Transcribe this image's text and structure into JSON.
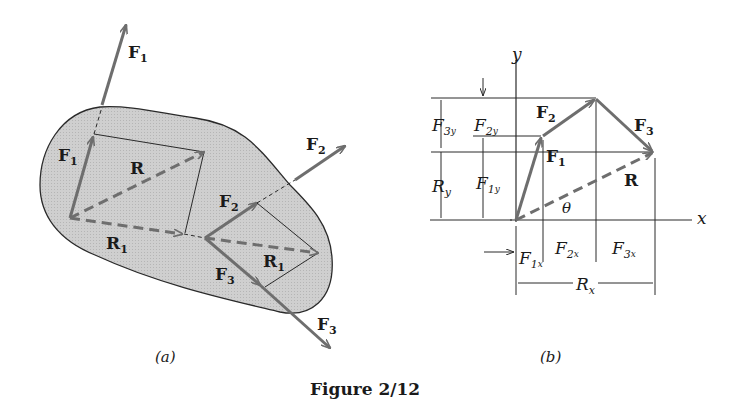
{
  "figure": {
    "caption": "Figure 2/12",
    "panel_a_label": "(a)",
    "panel_b_label": "(b)"
  },
  "colors": {
    "body_fill": "#c9c9c9",
    "body_outline": "#2a2a2a",
    "vector": "#6e6e6e",
    "line": "#2a2a2a",
    "text": "#1a1a1a"
  },
  "panel_a": {
    "labels": {
      "F1_outer": {
        "base": "F",
        "sub": "1"
      },
      "F1_inner": {
        "base": "F",
        "sub": "1"
      },
      "R": {
        "base": "R"
      },
      "R1_left": {
        "base": "R",
        "sub": "1"
      },
      "R1_right": {
        "base": "R",
        "sub": "1"
      },
      "F2_outer": {
        "base": "F",
        "sub": "2"
      },
      "F2_inner": {
        "base": "F",
        "sub": "2"
      },
      "F3_inner": {
        "base": "F",
        "sub": "3"
      },
      "F3_outer": {
        "base": "F",
        "sub": "3"
      }
    }
  },
  "panel_b": {
    "axes": {
      "x": "x",
      "y": "y"
    },
    "vectors": {
      "F1": {
        "base": "F",
        "sub": "1"
      },
      "F2": {
        "base": "F",
        "sub": "2"
      },
      "F3": {
        "base": "F",
        "sub": "3"
      },
      "R": {
        "base": "R"
      }
    },
    "angle": "θ",
    "dimensions": {
      "F3y": {
        "base": "F",
        "sub": "3",
        "subsub": "y"
      },
      "F2y": {
        "base": "F",
        "sub": "2",
        "subsub": "y"
      },
      "F1y": {
        "base": "F",
        "sub": "1",
        "subsub": "y"
      },
      "Ry": {
        "base": "R",
        "sub": "y"
      },
      "F1x": {
        "base": "F",
        "sub": "1",
        "subsub": "x"
      },
      "F2x": {
        "base": "F",
        "sub": "2",
        "subsub": "x"
      },
      "F3x": {
        "base": "F",
        "sub": "3",
        "subsub": "x"
      },
      "Rx": {
        "base": "R",
        "sub": "x"
      }
    }
  }
}
